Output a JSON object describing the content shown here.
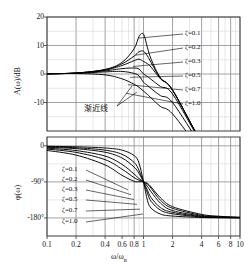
{
  "figure": {
    "xaxis": {
      "label": "ω/ωn",
      "label_main": "ω/ω",
      "label_sub": "n",
      "ticks": [
        "0.1",
        "0.2",
        "0.4",
        "0.6",
        "0.8",
        "1",
        "2",
        "4",
        "6",
        "8",
        "10"
      ],
      "tick_values": [
        0.1,
        0.2,
        0.4,
        0.6,
        0.8,
        1,
        2,
        4,
        6,
        8,
        10
      ],
      "range": [
        0.1,
        10
      ],
      "scale": "log"
    },
    "magnitude": {
      "ylabel": "A(ω)/dB",
      "yticks": [
        "20",
        "10",
        "0",
        "-10"
      ],
      "ytick_values": [
        20,
        10,
        0,
        -10
      ],
      "ylim": [
        -20,
        20
      ],
      "annotation": "渐近线"
    },
    "phase": {
      "ylabel": "φ(ω)",
      "yticks": [
        "0",
        "-90°",
        "-180°"
      ],
      "ytick_values": [
        0,
        -90,
        -180
      ],
      "ylim": [
        -225,
        22
      ]
    },
    "legend_magnitude": [
      {
        "label": "ζ=0.1",
        "zeta": 0.1
      },
      {
        "label": "ζ=0.2",
        "zeta": 0.2
      },
      {
        "label": "ζ=0.3",
        "zeta": 0.3
      },
      {
        "label": "ζ=0.5",
        "zeta": 0.5
      },
      {
        "label": "ζ=0.7",
        "zeta": 0.7
      },
      {
        "label": "ζ=1.0",
        "zeta": 1.0
      }
    ],
    "legend_phase": [
      {
        "label": "ζ=0.1",
        "zeta": 0.1
      },
      {
        "label": "ζ=0.2",
        "zeta": 0.2
      },
      {
        "label": "ζ=0.3",
        "zeta": 0.3
      },
      {
        "label": "ζ=0.5",
        "zeta": 0.5
      },
      {
        "label": "ζ=0.7",
        "zeta": 0.7
      },
      {
        "label": "ζ=1.0",
        "zeta": 1.0
      }
    ],
    "colors": {
      "curve": "#000000",
      "grid": "#8a8a8a",
      "frame": "#333333",
      "text": "#111111"
    }
  },
  "chart_data": {
    "type": "line",
    "title": "",
    "subtitle": "",
    "xlabel": "ω/ωn",
    "grid": true,
    "legend_position": "inside-right",
    "panels": [
      {
        "name": "magnitude",
        "ylabel": "A(ω)/dB",
        "ylim": [
          -20,
          20
        ],
        "xlim": [
          0.1,
          10
        ],
        "xscale": "log",
        "yticks": [
          20,
          10,
          0,
          -10
        ],
        "annotations": [
          {
            "text": "渐近线",
            "x": 0.55,
            "y": -10,
            "note": "asymptote; points to the low-frequency 0 dB line and the -40 dB/dec high-frequency line"
          }
        ],
        "series": [
          {
            "name": "ζ=0.1",
            "zeta": 0.1,
            "x": [
              0.1,
              0.2,
              0.4,
              0.6,
              0.8,
              0.9,
              1.0,
              1.1,
              1.2,
              1.5,
              2,
              4,
              6,
              8,
              10
            ],
            "values": [
              0.09,
              0.35,
              1.6,
              4.1,
              8.9,
              13.2,
              14.0,
              9.2,
              5.2,
              -1.4,
              -5.6,
              -24.0,
              -30.9,
              -35.9,
              -39.9
            ]
          },
          {
            "name": "ζ=0.2",
            "zeta": 0.2,
            "x": [
              0.1,
              0.2,
              0.4,
              0.6,
              0.8,
              0.9,
              1.0,
              1.1,
              1.2,
              1.5,
              2,
              4,
              6,
              8,
              10
            ],
            "values": [
              0.09,
              0.34,
              1.5,
              3.6,
              6.3,
              7.8,
              8.0,
              6.3,
              4.0,
              -1.5,
              -5.6,
              -24.0,
              -30.9,
              -35.9,
              -39.9
            ]
          },
          {
            "name": "ζ=0.3",
            "zeta": 0.3,
            "x": [
              0.1,
              0.2,
              0.4,
              0.6,
              0.8,
              0.9,
              1.0,
              1.1,
              1.2,
              1.5,
              2,
              4,
              6,
              8,
              10
            ],
            "values": [
              0.09,
              0.33,
              1.4,
              3.0,
              4.7,
              5.2,
              4.4,
              3.6,
              2.4,
              -1.7,
              -5.7,
              -24.0,
              -30.9,
              -35.9,
              -39.9
            ]
          },
          {
            "name": "ζ=0.5",
            "zeta": 0.5,
            "x": [
              0.1,
              0.2,
              0.4,
              0.6,
              0.8,
              0.9,
              1.0,
              1.1,
              1.2,
              1.5,
              2,
              4,
              6,
              8,
              10
            ],
            "values": [
              0.08,
              0.3,
              1.1,
              1.9,
              2.1,
              1.7,
              0.0,
              -0.9,
              -1.9,
              -4.4,
              -7.0,
              -24.3,
              -31.0,
              -36.0,
              -40.0
            ]
          },
          {
            "name": "ζ=0.7",
            "zeta": 0.7,
            "x": [
              0.1,
              0.2,
              0.4,
              0.6,
              0.8,
              0.9,
              1.0,
              1.1,
              1.2,
              1.5,
              2,
              4,
              6,
              8,
              10
            ],
            "values": [
              0.07,
              0.24,
              0.74,
              0.9,
              0.2,
              -0.7,
              -2.9,
              -4.0,
              -5.1,
              -7.6,
              -10.0,
              -25.3,
              -31.6,
              -36.4,
              -40.3
            ]
          },
          {
            "name": "ζ=1.0",
            "zeta": 1.0,
            "x": [
              0.1,
              0.2,
              0.4,
              0.6,
              0.8,
              0.9,
              1.0,
              1.1,
              1.2,
              1.5,
              2,
              4,
              6,
              8,
              10
            ],
            "values": [
              0.04,
              0.17,
              -0.3,
              -1.7,
              -3.6,
              -4.7,
              -6.0,
              -7.2,
              -8.4,
              -11.4,
              -14.0,
              -27.2,
              -33.0,
              -37.5,
              -41.2
            ]
          }
        ]
      },
      {
        "name": "phase",
        "ylabel": "φ(ω)",
        "ylim": [
          -225,
          22
        ],
        "xlim": [
          0.1,
          10
        ],
        "xscale": "log",
        "yticks": [
          0,
          -90,
          -180
        ],
        "series": [
          {
            "name": "ζ=0.1",
            "zeta": 0.1,
            "x": [
              0.1,
              0.2,
              0.4,
              0.6,
              0.8,
              0.9,
              1.0,
              1.1,
              1.2,
              1.5,
              2,
              4,
              6,
              8,
              10
            ],
            "values": [
              -1.2,
              -2.4,
              -5.4,
              -10.8,
              -24.2,
              -43.5,
              -90.0,
              -136.4,
              -155.6,
              -170.4,
              -175.2,
              -178.9,
              -179.5,
              -179.7,
              -179.8
            ]
          },
          {
            "name": "ζ=0.2",
            "zeta": 0.2,
            "x": [
              0.1,
              0.2,
              0.4,
              0.6,
              0.8,
              0.9,
              1.0,
              1.1,
              1.2,
              1.5,
              2,
              4,
              6,
              8,
              10
            ],
            "values": [
              -2.3,
              -4.8,
              -10.8,
              -21.2,
              -41.6,
              -61.6,
              -90.0,
              -118.4,
              -138.6,
              -160.5,
              -169.6,
              -177.7,
              -179.0,
              -179.4,
              -179.6
            ]
          },
          {
            "name": "ζ=0.3",
            "zeta": 0.3,
            "x": [
              0.1,
              0.2,
              0.4,
              0.6,
              0.8,
              0.9,
              1.0,
              1.1,
              1.2,
              1.5,
              2,
              4,
              6,
              8,
              10
            ],
            "values": [
              -3.5,
              -7.2,
              -16.0,
              -30.5,
              -53.1,
              -69.1,
              -90.0,
              -110.9,
              -129.4,
              -154.2,
              -166.0,
              -176.6,
              -178.5,
              -179.1,
              -179.4
            ]
          },
          {
            "name": "ζ=0.5",
            "zeta": 0.5,
            "x": [
              0.1,
              0.2,
              0.4,
              0.6,
              0.8,
              0.9,
              1.0,
              1.1,
              1.2,
              1.5,
              2,
              4,
              6,
              8,
              10
            ],
            "values": [
              -5.8,
              -11.8,
              -25.6,
              -46.4,
              -70.6,
              -81.9,
              -90.0,
              -101.4,
              -114.7,
              -143.1,
              -161.6,
              -175.2,
              -177.7,
              -178.6,
              -179.0
            ]
          },
          {
            "name": "ζ=0.7",
            "zeta": 0.7,
            "x": [
              0.1,
              0.2,
              0.4,
              0.6,
              0.8,
              0.9,
              1.0,
              1.1,
              1.2,
              1.5,
              2,
              4,
              6,
              8,
              10
            ],
            "values": [
              -8.1,
              -16.4,
              -34.5,
              -58.4,
              -79.4,
              -85.6,
              -90.0,
              -96.0,
              -106.2,
              -136.0,
              -156.0,
              -173.4,
              -176.7,
              -178.0,
              -178.6
            ]
          },
          {
            "name": "ζ=1.0",
            "zeta": 1.0,
            "x": [
              0.1,
              0.2,
              0.4,
              0.6,
              0.8,
              0.9,
              1.0,
              1.1,
              1.2,
              1.5,
              2,
              4,
              6,
              8,
              10
            ],
            "values": [
              -11.5,
              -23.1,
              -47.7,
              -73.7,
              -88.6,
              -89.6,
              -90.0,
              -93.8,
              -102.6,
              -129.8,
              -151.9,
              -171.1,
              -175.6,
              -177.3,
              -178.1
            ]
          }
        ]
      }
    ]
  }
}
